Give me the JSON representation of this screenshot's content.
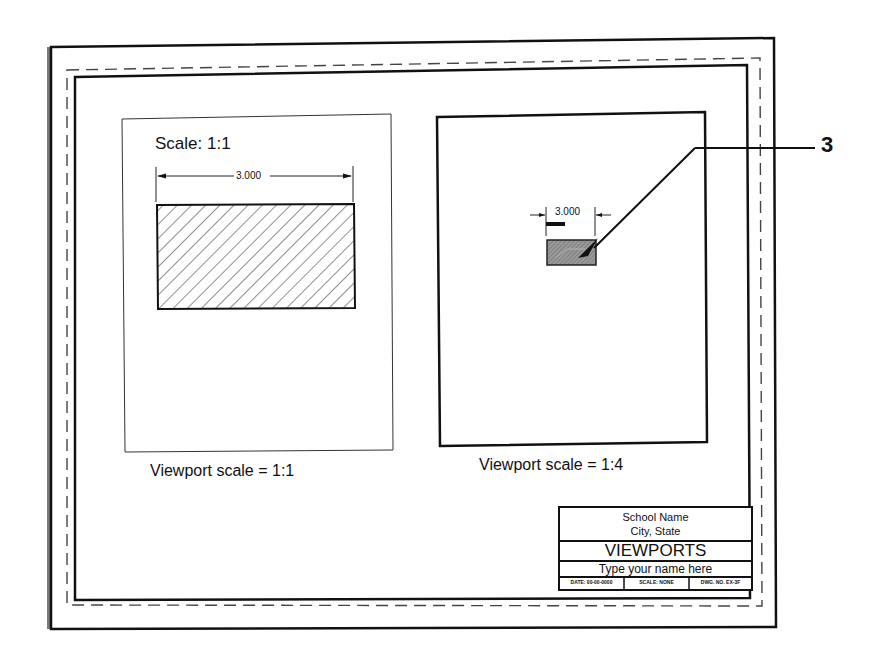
{
  "sheet": {
    "colors": {
      "line": "#111111",
      "edge_shadow": "#7a7a7a",
      "dashed": "#444444",
      "hatch_fill": "#8c8c8c",
      "background": "#ffffff"
    }
  },
  "viewport_left": {
    "note": "Scale: 1:1",
    "dimension": "3.000",
    "caption": "Viewport scale = 1:1"
  },
  "viewport_right": {
    "dimension": "3.000",
    "caption": "Viewport scale = 1:4"
  },
  "callout": {
    "number": "3"
  },
  "title_block": {
    "school": "School Name",
    "location": "City, State",
    "title": "VIEWPORTS",
    "name_field": "Type your name here",
    "date": "DATE: 00-00-0000",
    "scale": "SCALE: NONE",
    "dwg_no": "DWG. NO. EX-3F"
  }
}
